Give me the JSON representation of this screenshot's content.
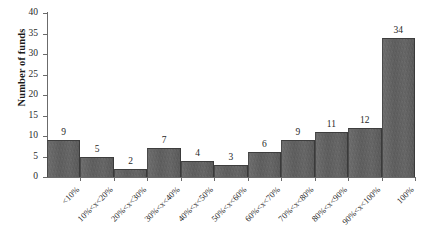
{
  "chart_data": {
    "type": "bar",
    "title": "",
    "xlabel": "",
    "ylabel": "Number of funds",
    "ylim": [
      0,
      40
    ],
    "ytick_labels": [
      "0",
      "5",
      "10",
      "15",
      "20",
      "25",
      "30",
      "35",
      "40"
    ],
    "ytick_values": [
      0,
      5,
      10,
      15,
      20,
      25,
      30,
      35,
      40
    ],
    "grid": false,
    "legend": false,
    "bar_color": "#616161",
    "categories": [
      "<10%",
      "10%<x<20%",
      "20%<x<30%",
      "30%<x<40%",
      "40%<x<50%",
      "50%<x<60%",
      "60%<x<70%",
      "70%<x<80%",
      "80%<x<90%",
      "90%<x<100%",
      "100%"
    ],
    "values": [
      9,
      5,
      2,
      7,
      4,
      3,
      6,
      9,
      11,
      12,
      34
    ],
    "value_labels": [
      "9",
      "5",
      "2",
      "7",
      "4",
      "3",
      "6",
      "9",
      "11",
      "12",
      "34"
    ]
  }
}
